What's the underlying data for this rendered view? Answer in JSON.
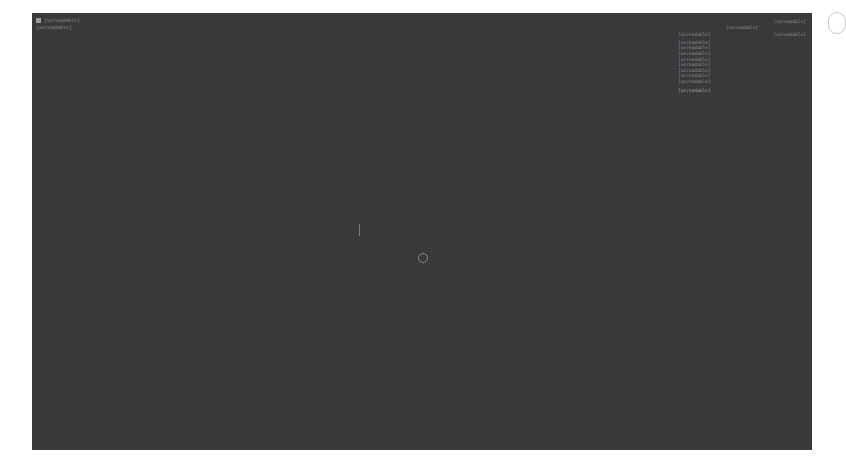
{
  "hud": {
    "top_left": {
      "icon": "app-icon",
      "title": "[unreadable]",
      "subtitle": "[unreadable]"
    },
    "info_panel": {
      "header": "[unreadable]",
      "title": "[unreadable]",
      "section_label": "[unreadable]",
      "section_value": "[unreadable]",
      "lines": [
        "[unreadable]",
        "[unreadable]",
        "[unreadable]",
        "[unreadable]",
        "[unreadable]",
        "[unreadable]",
        "[unreadable]",
        "[unreadable]"
      ],
      "footer": "[unreadable]"
    },
    "crosshair": "crosshair-ring-icon"
  },
  "colors": {
    "viewport_bg": "#3a3a3a",
    "hud_text": "#8c8c8c",
    "page_bg": "#ffffff"
  }
}
